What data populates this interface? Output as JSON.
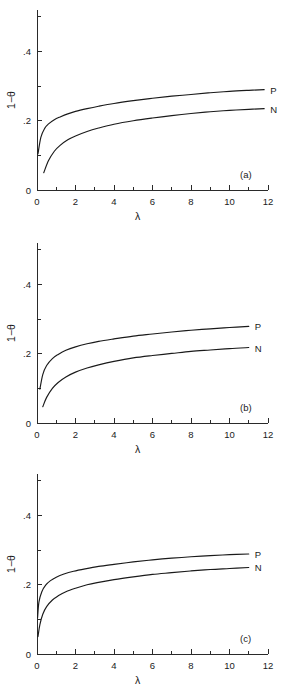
{
  "figure": {
    "name": "three-panel-saturation-curves",
    "background_color": "#ffffff",
    "line_color": "#1a1a1a"
  },
  "chart_data": [
    {
      "type": "line",
      "panel_label": "(a)",
      "title": "",
      "xlabel": "λ",
      "ylabel": "1−θ",
      "xlim": [
        0,
        12
      ],
      "ylim": [
        0,
        0.5
      ],
      "xticks": [
        0,
        2,
        4,
        6,
        8,
        10,
        12
      ],
      "xticklabels": [
        "0",
        "2",
        "4",
        "6",
        "8",
        "10",
        "12"
      ],
      "xminorticks": [
        1,
        3,
        5,
        7,
        9,
        11
      ],
      "yticks": [
        0,
        0.2,
        0.4
      ],
      "yticklabels": [
        "0",
        ".2",
        ".4"
      ],
      "yminorticks": [
        0.1,
        0.3,
        0.5
      ],
      "grid": false,
      "legend_position": "right-of-curve-ends",
      "series": [
        {
          "name": "P",
          "label": "P",
          "x": [
            0.05,
            0.2,
            0.4,
            0.6,
            0.9,
            1.2,
            1.6,
            2.0,
            2.6,
            3.2,
            4.0,
            5.0,
            6.0,
            7.0,
            8.0,
            9.0,
            10.0,
            11.0,
            11.8
          ],
          "values": [
            0.104,
            0.152,
            0.178,
            0.191,
            0.203,
            0.211,
            0.22,
            0.227,
            0.235,
            0.242,
            0.25,
            0.258,
            0.265,
            0.271,
            0.276,
            0.281,
            0.285,
            0.288,
            0.29
          ]
        },
        {
          "name": "N",
          "label": "N",
          "x": [
            0.35,
            0.6,
            0.9,
            1.2,
            1.6,
            2.0,
            2.6,
            3.2,
            4.0,
            5.0,
            6.0,
            7.0,
            8.0,
            9.0,
            10.0,
            11.0,
            11.8
          ],
          "values": [
            0.05,
            0.085,
            0.112,
            0.129,
            0.145,
            0.156,
            0.169,
            0.179,
            0.19,
            0.2,
            0.208,
            0.215,
            0.221,
            0.226,
            0.23,
            0.233,
            0.235
          ]
        }
      ]
    },
    {
      "type": "line",
      "panel_label": "(b)",
      "title": "",
      "xlabel": "λ",
      "ylabel": "1−θ",
      "xlim": [
        0,
        12
      ],
      "ylim": [
        0,
        0.5
      ],
      "xticks": [
        0,
        2,
        4,
        6,
        8,
        10,
        12
      ],
      "xticklabels": [
        "0",
        "2",
        "4",
        "6",
        "8",
        "10",
        "12"
      ],
      "xminorticks": [
        1,
        3,
        5,
        7,
        9,
        11
      ],
      "yticks": [
        0,
        0.2,
        0.4
      ],
      "yticklabels": [
        "0",
        ".2",
        ".4"
      ],
      "yminorticks": [
        0.1,
        0.3,
        0.5
      ],
      "grid": false,
      "legend_position": "right-of-curve-ends",
      "series": [
        {
          "name": "P",
          "label": "P",
          "x": [
            0.15,
            0.3,
            0.5,
            0.8,
            1.1,
            1.5,
            2.0,
            2.6,
            3.2,
            4.0,
            5.0,
            6.0,
            7.0,
            8.0,
            9.0,
            10.0,
            11.0
          ],
          "values": [
            0.098,
            0.14,
            0.166,
            0.186,
            0.198,
            0.21,
            0.22,
            0.229,
            0.236,
            0.243,
            0.251,
            0.257,
            0.263,
            0.268,
            0.272,
            0.276,
            0.279
          ]
        },
        {
          "name": "N",
          "label": "N",
          "x": [
            0.3,
            0.5,
            0.8,
            1.1,
            1.5,
            2.0,
            2.6,
            3.2,
            4.0,
            5.0,
            6.0,
            7.0,
            8.0,
            9.0,
            10.0,
            11.0
          ],
          "values": [
            0.047,
            0.074,
            0.1,
            0.117,
            0.133,
            0.147,
            0.159,
            0.168,
            0.178,
            0.188,
            0.195,
            0.201,
            0.207,
            0.211,
            0.215,
            0.218
          ]
        }
      ]
    },
    {
      "type": "line",
      "panel_label": "(c)",
      "title": "",
      "xlabel": "λ",
      "ylabel": "1−θ",
      "xlim": [
        0,
        12
      ],
      "ylim": [
        0,
        0.5
      ],
      "xticks": [
        0,
        2,
        4,
        6,
        8,
        10,
        12
      ],
      "xticklabels": [
        "0",
        "2",
        "4",
        "6",
        "8",
        "10",
        "12"
      ],
      "xminorticks": [
        1,
        3,
        5,
        7,
        9,
        11
      ],
      "yticks": [
        0,
        0.2,
        0.4
      ],
      "yticklabels": [
        "0",
        ".2",
        ".4"
      ],
      "yminorticks": [
        0.1,
        0.3,
        0.5
      ],
      "grid": false,
      "legend_position": "right-of-curve-ends",
      "series": [
        {
          "name": "P",
          "label": "P",
          "x": [
            0.03,
            0.1,
            0.25,
            0.45,
            0.7,
            1.0,
            1.4,
            1.9,
            2.5,
            3.2,
            4.0,
            5.0,
            6.0,
            7.0,
            8.0,
            9.0,
            10.0,
            11.0
          ],
          "values": [
            0.105,
            0.15,
            0.18,
            0.199,
            0.212,
            0.222,
            0.231,
            0.239,
            0.246,
            0.253,
            0.259,
            0.266,
            0.272,
            0.277,
            0.281,
            0.284,
            0.287,
            0.289
          ]
        },
        {
          "name": "N",
          "label": "N",
          "x": [
            0.05,
            0.15,
            0.3,
            0.5,
            0.8,
            1.1,
            1.5,
            2.0,
            2.6,
            3.2,
            4.0,
            5.0,
            6.0,
            7.0,
            8.0,
            9.0,
            10.0,
            11.0
          ],
          "values": [
            0.05,
            0.085,
            0.115,
            0.137,
            0.156,
            0.168,
            0.18,
            0.19,
            0.2,
            0.207,
            0.215,
            0.223,
            0.23,
            0.235,
            0.24,
            0.244,
            0.247,
            0.25
          ]
        }
      ]
    }
  ]
}
